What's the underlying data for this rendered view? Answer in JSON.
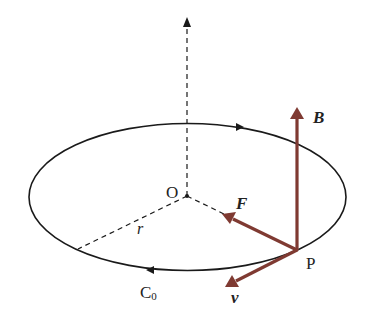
{
  "colors": {
    "background": "#ffffff",
    "stroke": "#1a1a1a",
    "vector": "#7f3a32",
    "text": "#222222"
  },
  "diagram": {
    "type": "physics-circular-motion-magnetic-field",
    "orbit": {
      "label": "C",
      "label_subscript": "0",
      "direction": "counter-clockwise (viewed from above)"
    },
    "center": {
      "label": "O"
    },
    "radius": {
      "label": "r"
    },
    "point": {
      "label": "P"
    },
    "vectors": [
      {
        "id": "B",
        "label": "B",
        "meaning": "magnetic field",
        "direction": "up (vertical)"
      },
      {
        "id": "F",
        "label": "F",
        "meaning": "force",
        "direction": "toward center O"
      },
      {
        "id": "v",
        "label": "v",
        "meaning": "velocity",
        "direction": "tangent to orbit"
      }
    ],
    "axis": {
      "style": "dashed",
      "direction": "vertical through O"
    }
  }
}
